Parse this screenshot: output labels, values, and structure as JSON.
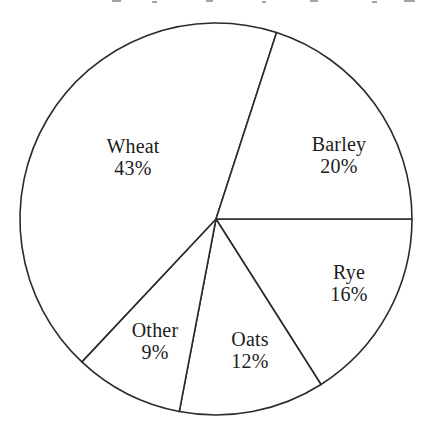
{
  "chart_data": {
    "type": "pie",
    "title": "",
    "subtitle": "",
    "xlabel": "",
    "ylabel": "",
    "legend_position": "none",
    "grid": false,
    "units": "percent",
    "total": 100,
    "start_angle_deg": 0,
    "direction": "clockwise",
    "categories": [
      "Rye",
      "Oats",
      "Other",
      "Wheat",
      "Barley"
    ],
    "values": [
      16,
      12,
      9,
      43,
      20
    ],
    "slices": [
      {
        "label": "Rye",
        "value": 16,
        "value_text": "16%",
        "start_angle_deg": 0,
        "end_angle_deg": 57.6,
        "label_x": 349,
        "label_y": 283
      },
      {
        "label": "Oats",
        "value": 12,
        "value_text": "12%",
        "start_angle_deg": 57.6,
        "end_angle_deg": 100.8,
        "label_x": 250,
        "label_y": 350
      },
      {
        "label": "Other",
        "value": 9,
        "value_text": "9%",
        "start_angle_deg": 100.8,
        "end_angle_deg": 133.2,
        "label_x": 155,
        "label_y": 341
      },
      {
        "label": "Wheat",
        "value": 43,
        "value_text": "43%",
        "start_angle_deg": 133.2,
        "end_angle_deg": 288,
        "label_x": 133,
        "label_y": 157
      },
      {
        "label": "Barley",
        "value": 20,
        "value_text": "20%",
        "start_angle_deg": 288,
        "end_angle_deg": 360,
        "label_x": 339,
        "label_y": 155
      }
    ],
    "geometry": {
      "center_x": 216,
      "center_y": 219,
      "radius": 196
    },
    "style": {
      "stroke_color": "#2b2b2b",
      "fill_color": "#ffffff",
      "background_color": "#ffffff",
      "stroke_width": 1.6,
      "label_color": "#1d1d1d"
    }
  }
}
